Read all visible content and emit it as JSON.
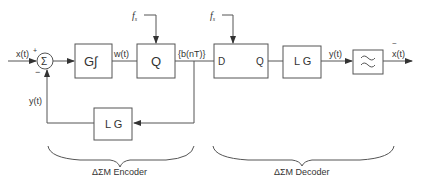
{
  "diagram": {
    "input_label": "x(t)",
    "plus_sign": "+",
    "minus_sign": "−",
    "sum_symbol": "Σ",
    "integrator_block": "G∫",
    "w_label": "w(t)",
    "quantizer_block": "Q",
    "fs_label_1": "f",
    "fs_label_1_sub": "s",
    "bitstream_label": "{b(nT)}",
    "dff_d": "D",
    "dff_q": "Q",
    "fs_label_2": "f",
    "fs_label_2_sub": "s",
    "decoder_lg_block": "L G",
    "decoder_y_label": "y(t)",
    "filter_symbol": "≈",
    "output_label": "x(t)",
    "output_tilde": "~",
    "feedback_lg_block": "L G",
    "feedback_y_label": "y(t)",
    "encoder_caption": "ΔΣM Encoder",
    "decoder_caption": "ΔΣM Decoder"
  },
  "colors": {
    "line": "#555555",
    "text": "#333333",
    "background": "#ffffff"
  }
}
